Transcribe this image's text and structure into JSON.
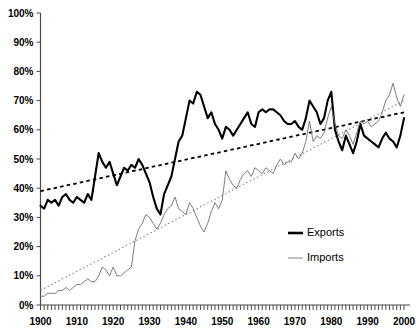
{
  "chart_data": {
    "type": "line",
    "title": "",
    "subtitle": "",
    "xlabel": "",
    "ylabel": "",
    "xlim": [
      1900,
      2000
    ],
    "ylim": [
      0,
      100
    ],
    "grid": false,
    "legend_position": "right-inside",
    "y_ticks": [
      0,
      10,
      20,
      30,
      40,
      50,
      60,
      70,
      80,
      90,
      100
    ],
    "y_tick_labels": [
      "0%",
      "10%",
      "20%",
      "30%",
      "40%",
      "50%",
      "60%",
      "70%",
      "80%",
      "90%",
      "100%"
    ],
    "x_ticks": [
      1900,
      1910,
      1920,
      1930,
      1940,
      1950,
      1960,
      1970,
      1980,
      1990,
      2000
    ],
    "x_tick_labels": [
      "1900",
      "1910",
      "1920",
      "1930",
      "1940",
      "1950",
      "1960",
      "1970",
      "1980",
      "1990",
      "2000"
    ],
    "x_minor_tick_interval": 1,
    "x": [
      1900,
      1901,
      1902,
      1903,
      1904,
      1905,
      1906,
      1907,
      1908,
      1909,
      1910,
      1911,
      1912,
      1913,
      1914,
      1915,
      1916,
      1917,
      1918,
      1919,
      1920,
      1921,
      1922,
      1923,
      1924,
      1925,
      1926,
      1927,
      1928,
      1929,
      1930,
      1931,
      1932,
      1933,
      1934,
      1935,
      1936,
      1937,
      1938,
      1939,
      1940,
      1941,
      1942,
      1943,
      1944,
      1945,
      1946,
      1947,
      1948,
      1949,
      1950,
      1951,
      1952,
      1953,
      1954,
      1955,
      1956,
      1957,
      1958,
      1959,
      1960,
      1961,
      1962,
      1963,
      1964,
      1965,
      1966,
      1967,
      1968,
      1969,
      1970,
      1971,
      1972,
      1973,
      1974,
      1975,
      1976,
      1977,
      1978,
      1979,
      1980,
      1981,
      1982,
      1983,
      1984,
      1985,
      1986,
      1987,
      1988,
      1989,
      1990,
      1991,
      1992,
      1993,
      1994,
      1995,
      1996,
      1997,
      1998,
      1999,
      2000
    ],
    "series": [
      {
        "name": "Exports",
        "color": "#000000",
        "style": "solid-thick",
        "values": [
          34,
          33,
          36,
          35,
          36,
          34,
          37,
          38,
          36,
          35,
          37,
          36,
          35,
          38,
          36,
          44,
          52,
          49,
          47,
          49,
          45,
          41,
          44,
          47,
          46,
          48,
          47,
          50,
          48,
          45,
          42,
          37,
          33,
          31,
          38,
          41,
          44,
          50,
          56,
          58,
          64,
          70,
          69,
          73,
          72,
          68,
          64,
          66,
          62,
          60,
          57,
          61,
          60,
          58,
          60,
          62,
          64,
          66,
          62,
          61,
          66,
          67,
          66,
          67,
          67,
          66,
          65,
          63,
          62,
          62,
          63,
          61,
          60,
          64,
          70,
          68,
          66,
          62,
          64,
          70,
          73,
          60,
          56,
          53,
          58,
          55,
          52,
          56,
          62,
          58,
          57,
          56,
          55,
          54,
          57,
          59,
          57,
          56,
          54,
          58,
          64
        ]
      },
      {
        "name": "Imports",
        "color": "#6e6e6e",
        "style": "solid-thin",
        "values": [
          3,
          3,
          4,
          4,
          4,
          5,
          5,
          6,
          5,
          6,
          7,
          7,
          8,
          9,
          8,
          8,
          10,
          13,
          12,
          10,
          13,
          10,
          10,
          11,
          12,
          13,
          22,
          26,
          28,
          31,
          30,
          28,
          26,
          28,
          31,
          33,
          34,
          37,
          33,
          32,
          31,
          35,
          33,
          30,
          27,
          25,
          28,
          32,
          35,
          33,
          36,
          46,
          43,
          41,
          40,
          43,
          45,
          46,
          44,
          47,
          46,
          45,
          47,
          46,
          45,
          48,
          50,
          48,
          49,
          49,
          52,
          50,
          52,
          56,
          63,
          56,
          58,
          57,
          59,
          64,
          68,
          62,
          58,
          57,
          60,
          58,
          55,
          59,
          63,
          62,
          63,
          61,
          62,
          63,
          66,
          70,
          72,
          76,
          71,
          68,
          72
        ]
      }
    ],
    "trendlines": [
      {
        "name": "Exports trend",
        "style": "dashed",
        "color": "#000000",
        "x": [
          1900,
          2000
        ],
        "y": [
          39,
          66
        ]
      },
      {
        "name": "Imports trend",
        "style": "dotted",
        "color": "#8a8a8a",
        "x": [
          1900,
          2000
        ],
        "y": [
          5,
          70
        ]
      }
    ],
    "legend": [
      {
        "label": "Exports",
        "color": "#000000",
        "style": "solid-thick"
      },
      {
        "label": "Imports",
        "color": "#8a8a8a",
        "style": "solid-thin"
      }
    ]
  }
}
